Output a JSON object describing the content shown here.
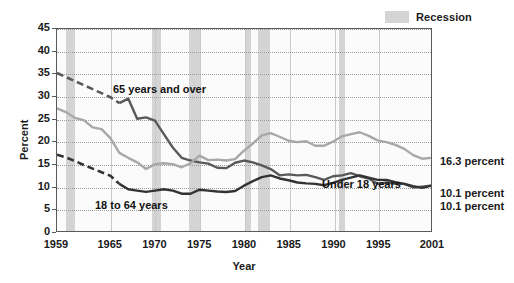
{
  "legend": {
    "recession_label": "Recession",
    "recession_color": "#d4d4d4"
  },
  "chart_data": {
    "type": "line",
    "title": "",
    "xlabel": "Year",
    "ylabel": "Percent",
    "xlim": [
      1959,
      2001
    ],
    "ylim": [
      0,
      45
    ],
    "ytick_labels": [
      "0",
      "5",
      "10",
      "15",
      "20",
      "25",
      "30",
      "35",
      "40",
      "45"
    ],
    "ytick_values": [
      0,
      5,
      10,
      15,
      20,
      25,
      30,
      35,
      40,
      45
    ],
    "xtick_labels": [
      "1959",
      "1965",
      "1970",
      "1975",
      "1980",
      "1985",
      "1990",
      "1995",
      "2001"
    ],
    "xtick_values": [
      1959,
      1965,
      1970,
      1975,
      1980,
      1985,
      1990,
      1995,
      2001
    ],
    "grid": "horizontal-dotted",
    "legend_position": "top-right",
    "series": [
      {
        "name": "65 years and over",
        "color": "#595959",
        "annotation": "65 years and over",
        "end_label": "10.1 percent",
        "end_value": 10.1,
        "dashed_segment_years": [
          1959,
          1966
        ],
        "x": [
          1959,
          1960,
          1961,
          1962,
          1963,
          1964,
          1965,
          1966,
          1967,
          1968,
          1969,
          1970,
          1971,
          1972,
          1973,
          1974,
          1975,
          1976,
          1977,
          1978,
          1979,
          1980,
          1981,
          1982,
          1983,
          1984,
          1985,
          1986,
          1987,
          1988,
          1989,
          1990,
          1991,
          1992,
          1993,
          1994,
          1995,
          1996,
          1997,
          1998,
          1999,
          2000,
          2001
        ],
        "values": [
          35.2,
          34.3,
          33.4,
          32.5,
          31.6,
          30.7,
          29.8,
          28.5,
          29.5,
          25.0,
          25.3,
          24.6,
          21.6,
          18.6,
          16.3,
          15.7,
          15.3,
          15.0,
          14.1,
          14.0,
          15.2,
          15.7,
          15.3,
          14.6,
          13.8,
          12.4,
          12.6,
          12.4,
          12.5,
          12.0,
          11.4,
          12.2,
          12.4,
          12.9,
          12.2,
          11.7,
          10.5,
          10.8,
          10.5,
          10.5,
          9.7,
          9.9,
          10.1
        ]
      },
      {
        "name": "Under 18 years",
        "color": "#a8a8a8",
        "annotation": "Under 18 years",
        "end_label": "16.3 percent",
        "end_value": 16.3,
        "dashed_segment_years": [],
        "x": [
          1959,
          1960,
          1961,
          1962,
          1963,
          1964,
          1965,
          1966,
          1967,
          1968,
          1969,
          1970,
          1971,
          1972,
          1973,
          1974,
          1975,
          1976,
          1977,
          1978,
          1979,
          1980,
          1981,
          1982,
          1983,
          1984,
          1985,
          1986,
          1987,
          1988,
          1989,
          1990,
          1991,
          1992,
          1993,
          1994,
          1995,
          1996,
          1997,
          1998,
          1999,
          2000,
          2001
        ],
        "values": [
          27.3,
          26.5,
          25.2,
          24.7,
          23.1,
          22.7,
          20.7,
          17.4,
          16.3,
          15.3,
          13.8,
          14.9,
          15.1,
          14.9,
          14.2,
          15.1,
          16.8,
          15.8,
          15.9,
          15.7,
          16.0,
          17.9,
          19.5,
          21.3,
          21.8,
          21.0,
          20.1,
          19.8,
          20.0,
          19.0,
          19.0,
          19.9,
          21.1,
          21.6,
          22.0,
          21.2,
          20.2,
          19.8,
          19.2,
          18.3,
          16.9,
          16.1,
          16.3
        ]
      },
      {
        "name": "18 to 64 years",
        "color": "#333333",
        "annotation": "18 to 64 years",
        "end_label": "10.1 percent",
        "end_value": 10.1,
        "dashed_segment_years": [
          1959,
          1966
        ],
        "x": [
          1959,
          1960,
          1961,
          1962,
          1963,
          1964,
          1965,
          1966,
          1967,
          1968,
          1969,
          1970,
          1971,
          1972,
          1973,
          1974,
          1975,
          1976,
          1977,
          1978,
          1979,
          1980,
          1981,
          1982,
          1983,
          1984,
          1985,
          1986,
          1987,
          1988,
          1989,
          1990,
          1991,
          1992,
          1993,
          1994,
          1995,
          1996,
          1997,
          1998,
          1999,
          2000,
          2001
        ],
        "values": [
          17.0,
          16.4,
          15.6,
          14.7,
          13.9,
          13.1,
          12.3,
          10.5,
          9.3,
          9.0,
          8.7,
          9.0,
          9.3,
          9.0,
          8.3,
          8.3,
          9.2,
          9.0,
          8.8,
          8.7,
          8.9,
          10.1,
          11.1,
          12.0,
          12.4,
          11.7,
          11.3,
          10.8,
          10.6,
          10.5,
          10.2,
          10.7,
          11.4,
          11.9,
          12.4,
          11.9,
          11.4,
          11.4,
          10.9,
          10.5,
          10.0,
          9.6,
          10.1
        ]
      }
    ],
    "recession_bands": [
      {
        "start": 1960.0,
        "end": 1961.0
      },
      {
        "start": 1969.6,
        "end": 1970.6
      },
      {
        "start": 1973.8,
        "end": 1975.1
      },
      {
        "start": 1980.0,
        "end": 1980.7
      },
      {
        "start": 1981.5,
        "end": 1982.8
      },
      {
        "start": 1990.5,
        "end": 1991.2
      },
      {
        "start": 2001.0,
        "end": 2001.9
      }
    ]
  }
}
